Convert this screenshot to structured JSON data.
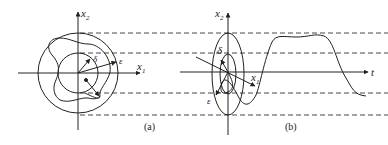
{
  "panel_a": {
    "caption": "(a)",
    "axis_x_label": "x",
    "axis_x_sub": "1",
    "axis_y_label": "x",
    "axis_y_sub": "2",
    "inner_radius_label": "δ",
    "outer_radius_label": "ε"
  },
  "panel_b": {
    "caption": "(b)",
    "axis_t_label": "t",
    "axis_x1_label": "x",
    "axis_x1_sub": "1",
    "axis_x2_label": "x",
    "axis_x2_sub": "2",
    "inner_label": "δ",
    "outer_label": "ε"
  },
  "colors": {
    "stroke": "#222222",
    "background": "#ffffff"
  }
}
